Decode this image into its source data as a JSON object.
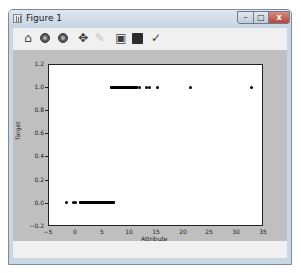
{
  "window": {
    "title": "Figure 1",
    "controls": {
      "minimize": "–",
      "maximize": "□",
      "close": "x"
    }
  },
  "toolbar": {
    "buttons": [
      {
        "name": "home",
        "icon": "home-icon",
        "glyph": "⌂"
      },
      {
        "name": "back",
        "icon": "back-icon",
        "glyph": ""
      },
      {
        "name": "forward",
        "icon": "forward-icon",
        "glyph": ""
      },
      {
        "name": "pan",
        "icon": "pan-icon",
        "glyph": "✥"
      },
      {
        "name": "zoom",
        "icon": "zoom-icon",
        "glyph": "✎"
      },
      {
        "name": "configure-subplots",
        "icon": "subplots-icon",
        "glyph": "▣"
      },
      {
        "name": "save",
        "icon": "save-icon",
        "glyph": "▪"
      },
      {
        "name": "edit-axis",
        "icon": "edit-icon",
        "glyph": "✓"
      }
    ]
  },
  "chart_data": {
    "type": "scatter",
    "title": "",
    "xlabel": "Attribute",
    "ylabel": "Target",
    "xlim": [
      -5,
      35
    ],
    "ylim": [
      -0.2,
      1.2
    ],
    "xticks": [
      -5,
      0,
      5,
      10,
      15,
      20,
      25,
      30,
      35
    ],
    "xtick_labels": [
      "−5",
      "0",
      "5",
      "10",
      "15",
      "20",
      "25",
      "30",
      "35"
    ],
    "yticks": [
      -0.2,
      0.0,
      0.2,
      0.4,
      0.6,
      0.8,
      1.0,
      1.2
    ],
    "ytick_labels": [
      "−0.2",
      "0.0",
      "0.2",
      "0.4",
      "0.6",
      "0.8",
      "1.0",
      "1.2"
    ],
    "grid": false,
    "legend": null,
    "series": [
      {
        "name": "target-0",
        "y": 0.0,
        "x_points": [
          -1.5,
          -0.2,
          0.2
        ],
        "x_dense_range": [
          1.1,
          7.1
        ]
      },
      {
        "name": "target-1",
        "y": 1.0,
        "x_points": [
          12.1,
          13.4,
          13.8,
          15.3,
          21.6,
          32.8
        ],
        "x_dense_range": [
          6.9,
          11.4
        ]
      }
    ]
  }
}
